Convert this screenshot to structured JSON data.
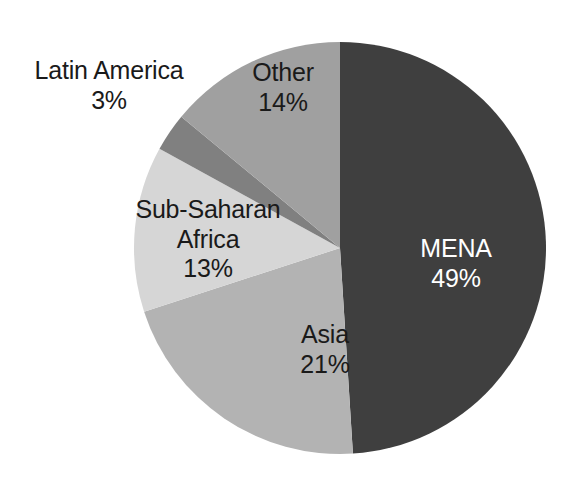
{
  "chart_data": {
    "type": "pie",
    "title": "",
    "subtitle": "",
    "xlabel": "",
    "ylabel": "",
    "legend_position": "none",
    "grid": false,
    "labels_inside": true,
    "value_unit": "%",
    "start_angle_deg": 0,
    "direction": "clockwise",
    "categories": [
      "MENA",
      "Asia",
      "Sub-Saharan Africa",
      "Latin America",
      "Other"
    ],
    "values": [
      49,
      21,
      13,
      3,
      14
    ],
    "colors": [
      "#3f3f3f",
      "#b3b3b3",
      "#d6d6d6",
      "#808080",
      "#a0a0a0"
    ],
    "slices": [
      {
        "name": "MENA",
        "label": "MENA",
        "value": 49,
        "value_text": "49%",
        "color": "#3f3f3f",
        "label_color": "#ffffff",
        "start_angle": 0,
        "end_angle": 176.4
      },
      {
        "name": "Asia",
        "label": "Asia",
        "value": 21,
        "value_text": "21%",
        "color": "#b3b3b3",
        "label_color": "#1a1a1a",
        "start_angle": 176.4,
        "end_angle": 252.0
      },
      {
        "name": "Sub-Saharan Africa",
        "label": "Sub-Saharan",
        "label_line2": "Africa",
        "value": 13,
        "value_text": "13%",
        "color": "#d6d6d6",
        "label_color": "#1a1a1a",
        "start_angle": 252.0,
        "end_angle": 298.8
      },
      {
        "name": "Latin America",
        "label": "Latin America",
        "value": 3,
        "value_text": "3%",
        "color": "#808080",
        "label_color": "#1a1a1a",
        "start_angle": 298.8,
        "end_angle": 309.6
      },
      {
        "name": "Other",
        "label": "Other",
        "value": 14,
        "value_text": "14%",
        "color": "#a0a0a0",
        "label_color": "#1a1a1a",
        "start_angle": 309.6,
        "end_angle": 360.0
      }
    ],
    "geometry": {
      "center_x": 340,
      "center_y": 248,
      "radius": 206
    },
    "background_color": "#ffffff"
  }
}
